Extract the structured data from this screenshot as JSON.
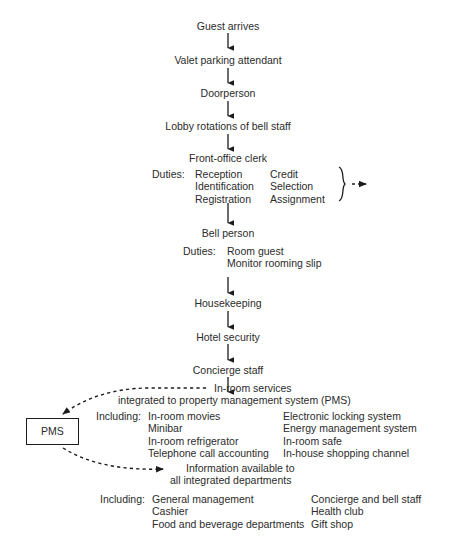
{
  "diagram": {
    "colors": {
      "text": "#2b2b2b",
      "line": "#1c1c1c",
      "background": "#ffffff"
    },
    "chain": [
      {
        "label": "Guest arrives"
      },
      {
        "label": "Valet parking attendant"
      },
      {
        "label": "Doorperson"
      },
      {
        "label": "Lobby rotations of bell staff"
      },
      {
        "label": "Front-office clerk"
      },
      {
        "label": "Bell person"
      },
      {
        "label": "Housekeeping"
      },
      {
        "label": "Hotel security"
      },
      {
        "label": "Concierge staff"
      }
    ],
    "clerk_duties": {
      "label": "Duties:",
      "column1": [
        "Reception",
        "Identification",
        "Registration"
      ],
      "column2": [
        "Credit",
        "Selection",
        "Assignment"
      ]
    },
    "bell_duties": {
      "label": "Duties:",
      "column1": [
        "Room guest",
        "Monitor rooming slip"
      ]
    },
    "inroom": {
      "line1": "In-room services",
      "line2": "integrated to property management system (PMS)",
      "including_label": "Including:",
      "column1": [
        "In-room movies",
        "Minibar",
        "In-room refrigerator",
        "Telephone call accounting"
      ],
      "column2": [
        "Electronic locking system",
        "Energy management system",
        "In-room safe",
        "In-house shopping channel"
      ]
    },
    "pms_box": {
      "label": "PMS"
    },
    "information": {
      "line1": "Information available to",
      "line2": "all integrated departments",
      "including_label": "Including:",
      "column1": [
        "General management",
        "Cashier",
        "Food and beverage departments"
      ],
      "column2": [
        "Concierge and bell staff",
        "Health club",
        "Gift shop"
      ]
    }
  }
}
